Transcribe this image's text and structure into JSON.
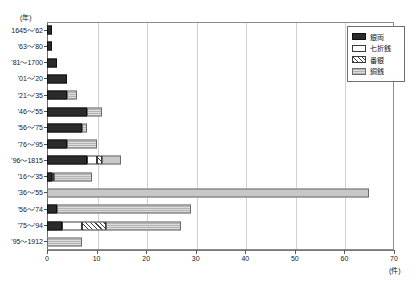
{
  "chart_data": {
    "type": "bar",
    "orientation": "horizontal",
    "stacked": true,
    "title": "",
    "xlabel": "(件)",
    "ylabel": "(年)",
    "xlim": [
      0,
      70
    ],
    "xticks": [
      0,
      10,
      20,
      30,
      40,
      50,
      60,
      70
    ],
    "xtick_labels": [
      "0",
      "10",
      "20",
      "30",
      "40",
      "50",
      "60",
      "70"
    ],
    "grid": "vertical",
    "legend_position": "top-right",
    "categories": [
      "1645～'62",
      "'63～'80",
      "'81～1700",
      "'01～'20",
      "'21～'35",
      "'46～'55",
      "'56～'75",
      "'76～'95",
      "'96～1815",
      "'16～'35",
      "'36～'55",
      "'56～'74",
      "'75～'94",
      "'95～1912"
    ],
    "series": [
      {
        "name": "銀両",
        "color": "#2b2b2b",
        "pattern": "solid",
        "values": [
          1,
          1,
          2,
          4,
          4,
          8,
          7,
          4,
          8,
          1,
          0,
          2,
          3,
          0
        ]
      },
      {
        "name": "七折銭",
        "color": "#ffffff",
        "pattern": "empty",
        "values": [
          0,
          0,
          0,
          0,
          0,
          0,
          0,
          0,
          2,
          0.5,
          0,
          0,
          4,
          0
        ]
      },
      {
        "name": "番銀",
        "color": "#3f3f3f",
        "pattern": "diagonal-hatch",
        "values": [
          0,
          0,
          0,
          0,
          0,
          0,
          0,
          0,
          1,
          0,
          0,
          0,
          5,
          0
        ]
      },
      {
        "name": "銅銭",
        "color": "#d4d4d4",
        "pattern": "fine-dotted",
        "values": [
          0,
          0,
          0,
          0,
          2,
          3,
          1,
          6,
          4,
          7.5,
          65,
          27,
          15,
          7
        ]
      }
    ],
    "totals": [
      1,
      1,
      2,
      4,
      6,
      11,
      8,
      10,
      15,
      9,
      65,
      29,
      27,
      7
    ]
  },
  "legend": {
    "items": [
      {
        "label": "銀両"
      },
      {
        "label": "七折銭"
      },
      {
        "label": "番銀"
      },
      {
        "label": "銅銭"
      }
    ]
  }
}
